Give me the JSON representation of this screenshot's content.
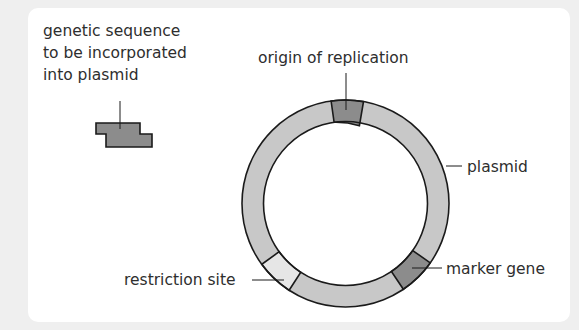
{
  "diagram": {
    "type": "plasmid-schematic",
    "labels": {
      "insert": [
        "genetic sequence",
        "to be incorporated",
        "into plasmid"
      ],
      "origin": "origin of replication",
      "plasmid": "plasmid",
      "marker": "marker gene",
      "restriction": "restriction site"
    },
    "colors": {
      "background": "#efefef",
      "panel": "#ffffff",
      "ring": "#c8c8c8",
      "dark_segment": "#8c8c8c",
      "restriction_segment": "#e6e6e6",
      "stroke": "#1a1a1a",
      "text": "#2e2e2e"
    },
    "segments": [
      {
        "name": "origin of replication",
        "start_deg": -98,
        "end_deg": -80
      },
      {
        "name": "marker gene",
        "start_deg": 35,
        "end_deg": 56
      },
      {
        "name": "restriction site",
        "start_deg": 123,
        "end_deg": 144
      }
    ]
  }
}
